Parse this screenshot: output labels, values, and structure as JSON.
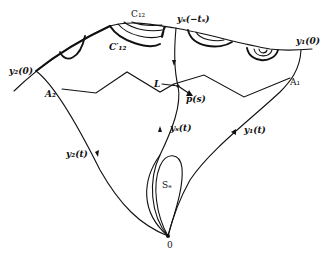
{
  "diagram": {
    "type": "phase-portrait",
    "colors": {
      "stroke": "#111111",
      "background": "#ffffff"
    },
    "labels": {
      "c12": "C₁₂",
      "c12_prime": "C′₁₂",
      "ys_neg_ts": "yₛ(−tₛ)",
      "y1_0": "y₁(0)",
      "y2_0": "y₂(0)",
      "a1": "A₁",
      "a2": "A₂",
      "L": "L",
      "ps": "p(s)",
      "ys_t": "yₛ(t)",
      "y1_t": "y₁(t)",
      "y2_t": "y₂(t)",
      "se": "Sₑ",
      "origin": "0"
    },
    "curves": [
      "upper-boundary-arc",
      "trajectory-y1",
      "trajectory-y2",
      "trajectory-ys",
      "zigzag-line-L",
      "loop-Se",
      "nested-arcs-C12",
      "semicircle-arcs"
    ]
  }
}
